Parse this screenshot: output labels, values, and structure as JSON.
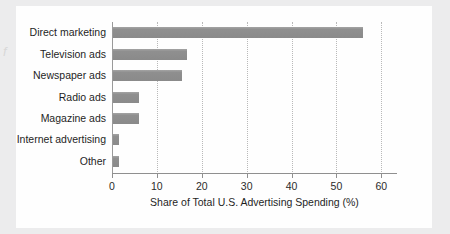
{
  "chart_data": {
    "type": "bar",
    "orientation": "horizontal",
    "title": "",
    "xlabel": "Share of Total U.S. Advertising Spending (%)",
    "ylabel": "",
    "categories": [
      "Direct marketing",
      "Television ads",
      "Newspaper ads",
      "Radio ads",
      "Magazine ads",
      "Internet advertising",
      "Other"
    ],
    "values": [
      55.7,
      16.5,
      15.4,
      5.9,
      5.9,
      1.4,
      1.3
    ],
    "xlim": [
      0,
      63.5
    ],
    "xticks": [
      0,
      10,
      20,
      30,
      40,
      50,
      60
    ],
    "xticklabels": [
      "0",
      "10",
      "20",
      "30",
      "40",
      "50",
      "60"
    ],
    "grid": "vertical-dotted",
    "legend": "none",
    "bar_color": "#8a8a8a",
    "gridline_color": "#b9b9b9",
    "axis_color": "#8f8f8f",
    "panel_color": "#fefefe",
    "background_color": "#ececed",
    "edge_artifact": "f"
  }
}
